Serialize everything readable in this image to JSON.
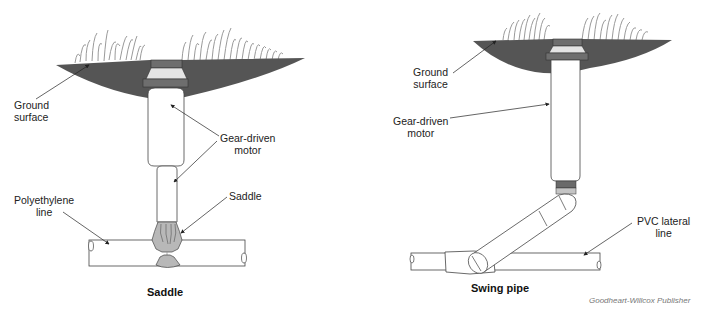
{
  "diagrams": [
    {
      "id": "left",
      "caption": "Saddle",
      "labels": {
        "ground_surface_1": "Ground",
        "ground_surface_2": "surface",
        "motor_1": "Gear-driven",
        "motor_2": "motor",
        "poly_1": "Polyethylene",
        "poly_2": "line",
        "saddle": "Saddle"
      }
    },
    {
      "id": "right",
      "caption": "Swing pipe",
      "labels": {
        "ground_surface_1": "Ground",
        "ground_surface_2": "surface",
        "motor_1": "Gear-driven",
        "motor_2": "motor",
        "pvc_1": "PVC lateral",
        "pvc_2": "line"
      }
    }
  ],
  "credit": "Goodheart-Willcox Publisher",
  "colors": {
    "ground": "#555555",
    "collar_dark": "#6e6e6e",
    "collar_light": "#e4e4e4",
    "saddle_fill": "#b8b8b8",
    "ring_dark": "#6a6a6a",
    "ring_light": "#c4c4c4",
    "grass": "#9a9a9a",
    "outline": "#444444"
  }
}
